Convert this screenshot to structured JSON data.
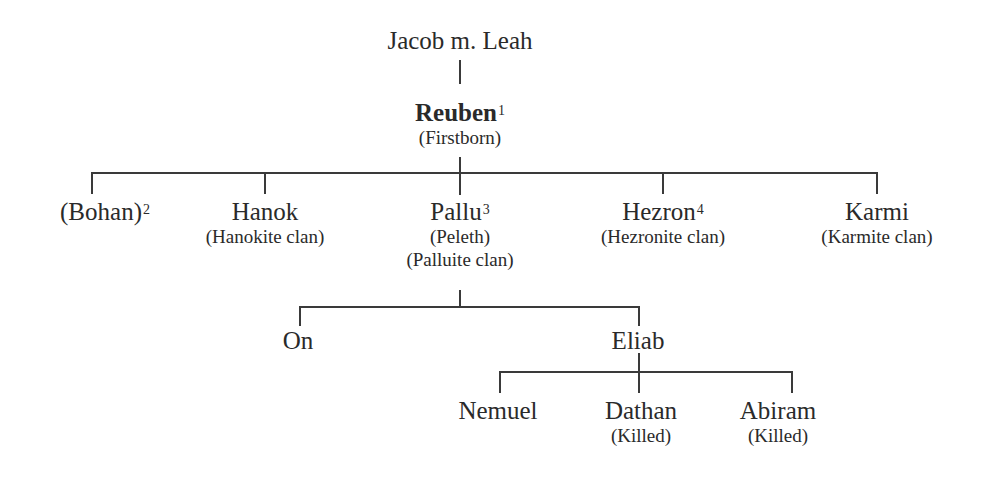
{
  "diagram": {
    "type": "family-tree",
    "root": {
      "name": "Jacob m. Leah"
    },
    "reuben": {
      "name": "Reuben",
      "footnote": "1",
      "note": "(Firstborn)"
    },
    "sons": [
      {
        "name": "(Bohan)",
        "footnote": "2",
        "notes": []
      },
      {
        "name": "Hanok",
        "footnote": "",
        "notes": [
          "(Hanokite clan)"
        ]
      },
      {
        "name": "Pallu",
        "footnote": "3",
        "notes": [
          "(Peleth)",
          "(Palluite clan)"
        ]
      },
      {
        "name": "Hezron",
        "footnote": "4",
        "notes": [
          "(Hezronite clan)"
        ]
      },
      {
        "name": "Karmi",
        "footnote": "",
        "notes": [
          "(Karmite clan)"
        ]
      }
    ],
    "pallu_sons": [
      {
        "name": "On"
      },
      {
        "name": "Eliab"
      }
    ],
    "eliab_sons": [
      {
        "name": "Nemuel",
        "note": ""
      },
      {
        "name": "Dathan",
        "note": "(Killed)"
      },
      {
        "name": "Abiram",
        "note": "(Killed)"
      }
    ],
    "colors": {
      "line": "#3a3a3a",
      "text": "#2a2a2a",
      "background": "#ffffff"
    }
  }
}
